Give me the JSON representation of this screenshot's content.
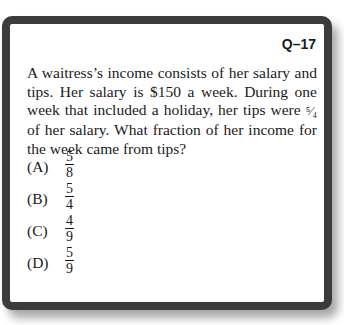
{
  "question": {
    "number": "Q–17",
    "stem_part1": "A waitress’s income consists of her salary and tips. Her salary is $150 a week. During one week that included a holiday, her tips were ",
    "tips_fraction": "⁵⁄₄",
    "stem_part2": " of her salary. What fraction of her income for the week came from tips?",
    "choices": [
      {
        "letter": "(A)",
        "num": "5",
        "den": "8"
      },
      {
        "letter": "(B)",
        "num": "5",
        "den": "4"
      },
      {
        "letter": "(C)",
        "num": "4",
        "den": "9"
      },
      {
        "letter": "(D)",
        "num": "5",
        "den": "9"
      }
    ]
  }
}
